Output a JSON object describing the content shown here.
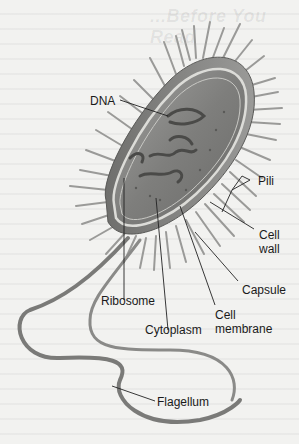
{
  "figure": {
    "background_show_through_heading": "...Before You Read",
    "colors": {
      "page": "#f2f2f0",
      "cell_body": "#8a8a88",
      "cell_wall": "#d8d8d4",
      "pili": "#9a9a98",
      "flagellum": "#7a7a78",
      "leader_line": "#222222",
      "label_text": "#1a1a1a"
    },
    "labels": {
      "dna": "DNA",
      "pili": "Pili",
      "cell_wall": "Cell\nwall",
      "capsule": "Capsule",
      "ribosome": "Ribosome",
      "cell_membrane": "Cell\nmembrane",
      "cytoplasm": "Cytoplasm",
      "flagellum": "Flagellum"
    }
  }
}
